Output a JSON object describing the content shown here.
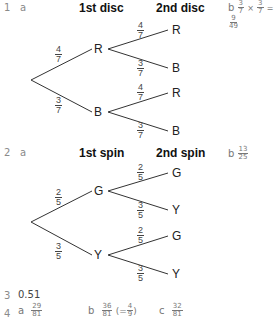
{
  "q1": {
    "number": "1",
    "part_a": "a",
    "headers": [
      "1st disc",
      "2nd disc"
    ],
    "tree": {
      "first": [
        {
          "label": "R",
          "prob": {
            "n": "4",
            "d": "7"
          }
        },
        {
          "label": "B",
          "prob": {
            "n": "3",
            "d": "7"
          }
        }
      ],
      "second": [
        {
          "label": "R",
          "prob": {
            "n": "4",
            "d": "7"
          }
        },
        {
          "label": "B",
          "prob": {
            "n": "3",
            "d": "7"
          }
        },
        {
          "label": "R",
          "prob": {
            "n": "4",
            "d": "7"
          }
        },
        {
          "label": "B",
          "prob": {
            "n": "3",
            "d": "7"
          }
        }
      ]
    },
    "part_b": "b",
    "answer_b": {
      "f1": {
        "n": "3",
        "d": "7"
      },
      "times": "×",
      "f2": {
        "n": "3",
        "d": "7"
      },
      "eq": "=",
      "result": {
        "n": "9",
        "d": "49"
      }
    }
  },
  "q2": {
    "number": "2",
    "part_a": "a",
    "headers": [
      "1st spin",
      "2nd spin"
    ],
    "tree": {
      "first": [
        {
          "label": "G",
          "prob": {
            "n": "2",
            "d": "5"
          }
        },
        {
          "label": "Y",
          "prob": {
            "n": "3",
            "d": "5"
          }
        }
      ],
      "second": [
        {
          "label": "G",
          "prob": {
            "n": "2",
            "d": "5"
          }
        },
        {
          "label": "Y",
          "prob": {
            "n": "3",
            "d": "5"
          }
        },
        {
          "label": "G",
          "prob": {
            "n": "2",
            "d": "5"
          }
        },
        {
          "label": "Y",
          "prob": {
            "n": "3",
            "d": "5"
          }
        }
      ]
    },
    "part_b": "b",
    "answer_b": {
      "n": "13",
      "d": "25"
    }
  },
  "q3": {
    "number": "3",
    "answer": "0.51"
  },
  "q4": {
    "number": "4",
    "a": {
      "label": "a",
      "n": "29",
      "d": "81"
    },
    "b": {
      "label": "b",
      "n": "36",
      "d": "81",
      "open": "(=",
      "alt": {
        "n": "4",
        "d": "9"
      },
      "close": ")"
    },
    "c": {
      "label": "c",
      "n": "32",
      "d": "81"
    }
  }
}
